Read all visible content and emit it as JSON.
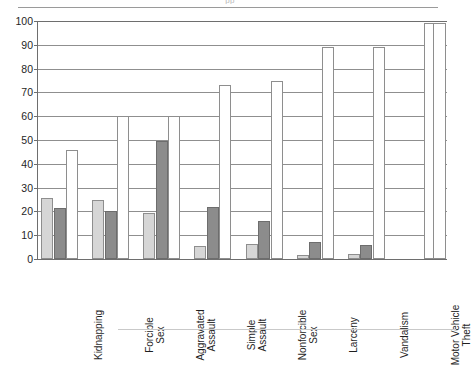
{
  "chart_data": {
    "type": "bar",
    "title": "",
    "clipped_title_fragment": "pp",
    "xlabel": "",
    "ylabel": "",
    "ylim": [
      0,
      100
    ],
    "yticks": [
      0,
      10,
      20,
      30,
      40,
      50,
      60,
      70,
      80,
      90,
      100
    ],
    "ytick_labels": [
      "0",
      "10",
      "20",
      "30",
      "40",
      "50",
      "60",
      "70",
      "80",
      "90",
      "100"
    ],
    "grid": true,
    "grid_axis": "y",
    "legend": "none",
    "categories": [
      "Kidnapping",
      "Forcible\nSex",
      "Aggravated\nAssault",
      "Simple\nAssault",
      "Nonforcible\nSex",
      "Larceny",
      "Vandalism",
      "Motor Vehicle\nTheft"
    ],
    "series": [
      {
        "name": "series-1",
        "style": "light-gray-fill",
        "color": "#d6d6d6",
        "values": [
          25.5,
          25.0,
          19.5,
          5.5,
          6.5,
          1.5,
          2.0,
          0
        ]
      },
      {
        "name": "series-2",
        "style": "dark-gray-fill",
        "color": "#8c8c8c",
        "values": [
          21.5,
          20.0,
          49.5,
          22.0,
          16.0,
          7.0,
          6.0,
          0
        ]
      },
      {
        "name": "series-3",
        "style": "white-open",
        "color": "#ffffff",
        "values": [
          46.0,
          60.0,
          60.0,
          73.0,
          75.0,
          89.0,
          89.0,
          99.0
        ]
      }
    ],
    "extra_bar": {
      "name": "right-edge-open-bar",
      "style": "white-open",
      "value": 99.0
    }
  },
  "axes": {
    "y_axis_name": "y-axis",
    "x_axis_name": "x-axis"
  }
}
